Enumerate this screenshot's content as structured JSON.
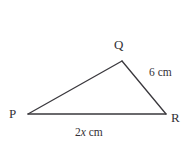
{
  "figure": {
    "name": "triangle-pqr",
    "background_color": "#ffffff",
    "stroke_color": "#3a383d",
    "text_color": "#333136",
    "vertices": {
      "P": {
        "label": "P",
        "x": 28,
        "y": 114
      },
      "Q": {
        "label": "Q",
        "x": 122,
        "y": 61
      },
      "R": {
        "label": "R",
        "x": 166,
        "y": 114
      }
    },
    "sides": [
      {
        "name": "PQ",
        "from": "P",
        "to": "Q",
        "label": ""
      },
      {
        "name": "QR",
        "from": "Q",
        "to": "R",
        "label": "6 cm"
      },
      {
        "name": "PR",
        "from": "P",
        "to": "R",
        "label": "2x cm"
      }
    ],
    "labels": {
      "vertex_p": "P",
      "vertex_q": "Q",
      "vertex_r": "R",
      "side_qr": "6 cm",
      "side_pr_coefficient": "2",
      "side_pr_variable": "x",
      "side_pr_unit": " cm"
    }
  }
}
